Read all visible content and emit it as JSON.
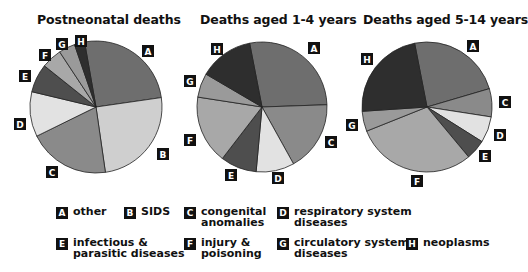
{
  "chart_data": [
    {
      "type": "pie",
      "title": "Postneonatal deaths",
      "categories": [
        "A",
        "B",
        "C",
        "D",
        "E",
        "F",
        "G",
        "H"
      ],
      "values": [
        25.5,
        25,
        20,
        11,
        7,
        5,
        4,
        2.5
      ],
      "unit": "percent (estimated)"
    },
    {
      "type": "pie",
      "title": "Deaths aged 1-4 years",
      "categories": [
        "A",
        "C",
        "D",
        "E",
        "F",
        "G",
        "H"
      ],
      "values": [
        27.5,
        17.5,
        9.5,
        9,
        17,
        6,
        13.5
      ],
      "unit": "percent (estimated)"
    },
    {
      "type": "pie",
      "title": "Deaths aged 5-14 years",
      "categories": [
        "A",
        "C",
        "D",
        "E",
        "F",
        "G",
        "H"
      ],
      "values": [
        23.5,
        7,
        6.5,
        5,
        30,
        5,
        23
      ],
      "unit": "percent (estimated)"
    }
  ],
  "legend": [
    {
      "key": "A",
      "label": "other",
      "color": "#6e6e6e"
    },
    {
      "key": "B",
      "label": "SIDS",
      "color": "#cfcfcf"
    },
    {
      "key": "C",
      "label": "congenital\nanomalies",
      "color": "#8a8a8a"
    },
    {
      "key": "D",
      "label": "respiratory system\ndiseases",
      "color": "#e2e2e2"
    },
    {
      "key": "E",
      "label": "infectious &\nparasitic diseases",
      "color": "#4e4e4e"
    },
    {
      "key": "F",
      "label": "injury &\npoisoning",
      "color": "#a8a8a8"
    },
    {
      "key": "G",
      "label": "circulatory system\ndiseases",
      "color": "#9a9a9a"
    },
    {
      "key": "H",
      "label": "neoplasms",
      "color": "#2e2e2e"
    }
  ],
  "pies": [
    {
      "cx": 96,
      "cy": 107,
      "r": 66,
      "start": -10,
      "labels": [
        {
          "key": "A",
          "x": 142,
          "y": 45
        },
        {
          "key": "B",
          "x": 157,
          "y": 148
        },
        {
          "key": "C",
          "x": 46,
          "y": 166
        },
        {
          "key": "D",
          "x": 14,
          "y": 118
        },
        {
          "key": "E",
          "x": 19,
          "y": 70
        },
        {
          "key": "F",
          "x": 39,
          "y": 49
        },
        {
          "key": "G",
          "x": 56,
          "y": 38
        },
        {
          "key": "H",
          "x": 75,
          "y": 35
        }
      ]
    },
    {
      "cx": 262,
      "cy": 107,
      "r": 65,
      "start": -11,
      "labels": [
        {
          "key": "A",
          "x": 308,
          "y": 42
        },
        {
          "key": "C",
          "x": 325,
          "y": 136
        },
        {
          "key": "D",
          "x": 272,
          "y": 172
        },
        {
          "key": "E",
          "x": 225,
          "y": 169
        },
        {
          "key": "F",
          "x": 184,
          "y": 134
        },
        {
          "key": "G",
          "x": 184,
          "y": 75
        },
        {
          "key": "H",
          "x": 211,
          "y": 43
        }
      ]
    },
    {
      "cx": 427,
      "cy": 107,
      "r": 65,
      "start": -11,
      "labels": [
        {
          "key": "A",
          "x": 467,
          "y": 40
        },
        {
          "key": "C",
          "x": 499,
          "y": 96
        },
        {
          "key": "D",
          "x": 494,
          "y": 129
        },
        {
          "key": "E",
          "x": 479,
          "y": 150
        },
        {
          "key": "F",
          "x": 411,
          "y": 175
        },
        {
          "key": "G",
          "x": 346,
          "y": 119
        },
        {
          "key": "H",
          "x": 361,
          "y": 53
        }
      ]
    }
  ]
}
